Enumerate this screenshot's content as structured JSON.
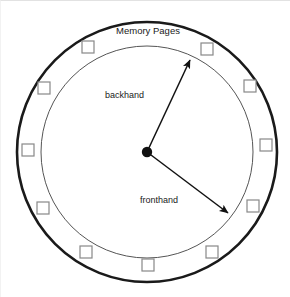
{
  "figure": {
    "type": "two-handed-clock-page-replacement-diagram",
    "title": "Memory Pages",
    "labels": {
      "backhand": "backhand",
      "fronthand": "fronthand"
    },
    "colors": {
      "background": "#ffffff",
      "outer_ring_stroke": "#1a1a1a",
      "inner_ring_stroke": "#555555",
      "page_box_stroke": "#888888",
      "page_box_fill": "#ffffff",
      "hub_fill": "#111111",
      "hand_stroke": "#111111",
      "text": "#1a1a1a",
      "frame_border": "#e2e2e2"
    },
    "geometry": {
      "center_x": 147,
      "center_y": 152,
      "outer_radius": 130,
      "inner_radius": 106,
      "hub_radius": 5,
      "page_box_size": 12,
      "page_box_orbit_radius": 119
    },
    "page_boxes": [
      {
        "name": "page-frame-1",
        "angle_deg": -60,
        "x": 207,
        "y": 49
      },
      {
        "name": "page-frame-2",
        "angle_deg": -30,
        "x": 250,
        "y": 86
      },
      {
        "name": "page-frame-3",
        "angle_deg": 0,
        "x": 266,
        "y": 145
      },
      {
        "name": "page-frame-4",
        "angle_deg": 30,
        "x": 253,
        "y": 206
      },
      {
        "name": "page-frame-5",
        "angle_deg": 60,
        "x": 212,
        "y": 252
      },
      {
        "name": "page-frame-6",
        "angle_deg": 90,
        "x": 148,
        "y": 265
      },
      {
        "name": "page-frame-7",
        "angle_deg": 120,
        "x": 86,
        "y": 252
      },
      {
        "name": "page-frame-8",
        "angle_deg": 150,
        "x": 43,
        "y": 208
      },
      {
        "name": "page-frame-9",
        "angle_deg": 180,
        "x": 28,
        "y": 150
      },
      {
        "name": "page-frame-10",
        "angle_deg": 210,
        "x": 44,
        "y": 88
      },
      {
        "name": "page-frame-11",
        "angle_deg": 240,
        "x": 88,
        "y": 47
      }
    ],
    "hands": [
      {
        "name": "backhand",
        "label": "backhand",
        "angle_deg": -65,
        "tip_x": 190,
        "tip_y": 60,
        "label_x": 144,
        "label_y": 98,
        "label_anchor": "end"
      },
      {
        "name": "fronthand",
        "label": "fronthand",
        "angle_deg": 37,
        "tip_x": 228,
        "tip_y": 213,
        "label_x": 178,
        "label_y": 203,
        "label_anchor": "end"
      }
    ],
    "title_position": {
      "x": 148,
      "y": 34
    }
  }
}
